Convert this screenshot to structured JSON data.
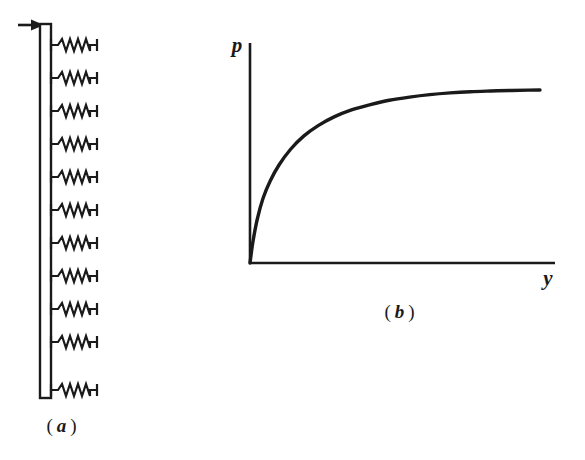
{
  "figure": {
    "ink_color": "#1a1a1a",
    "background_color": "#ffffff"
  },
  "panel_a": {
    "caption_open": "(",
    "caption_letter": "a",
    "caption_close": ")",
    "caption_full": "( a )",
    "wall": {
      "name": "vertical wall",
      "x_left": 40,
      "x_right": 51,
      "y_top": 24,
      "y_bottom": 398
    },
    "load_arrow": {
      "name": "applied load arrow",
      "direction": "right",
      "x_start": 18,
      "x_end": 42,
      "y": 25
    },
    "springs": {
      "count": 11,
      "label": "elastic subgrade springs",
      "y_positions": [
        45,
        78,
        111,
        144,
        177,
        210,
        243,
        276,
        309,
        342,
        390
      ],
      "x_start": 51,
      "x_end": 100,
      "coils": 4
    }
  },
  "panel_b": {
    "caption_open": "(",
    "caption_letter": "b",
    "caption_close": ")",
    "caption_full": "( b )",
    "y_axis_label": "p",
    "x_axis_label": "y",
    "axes": {
      "origin_x": 250,
      "origin_y": 263,
      "y_axis_top": 43,
      "x_axis_right": 555
    }
  },
  "chart_data": {
    "type": "line",
    "title": "",
    "subtitle": "",
    "xlabel": "y",
    "ylabel": "p",
    "xlim": [
      0,
      1
    ],
    "ylim": [
      0,
      1
    ],
    "grid": false,
    "legend": null,
    "annotations": [],
    "series": [
      {
        "name": "pressure-displacement",
        "description": "saturating exponential approach to ultimate pressure plateau",
        "x": [
          0.0,
          0.01,
          0.025,
          0.045,
          0.07,
          0.1,
          0.14,
          0.185,
          0.235,
          0.29,
          0.35,
          0.415,
          0.48,
          0.55,
          0.62,
          0.69,
          0.76,
          0.83,
          0.9,
          0.96,
          1.0
        ],
        "y": [
          0.0,
          0.12,
          0.25,
          0.37,
          0.47,
          0.56,
          0.65,
          0.725,
          0.785,
          0.835,
          0.875,
          0.905,
          0.93,
          0.948,
          0.962,
          0.972,
          0.979,
          0.983,
          0.986,
          0.988,
          0.989
        ]
      }
    ]
  }
}
